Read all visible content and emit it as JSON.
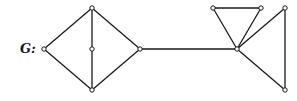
{
  "graph": {
    "label": "G:",
    "vertices": [
      {
        "id": "v1",
        "x": 44,
        "y": 49
      },
      {
        "id": "v2",
        "x": 92,
        "y": 8
      },
      {
        "id": "v3",
        "x": 92,
        "y": 49
      },
      {
        "id": "v4",
        "x": 92,
        "y": 90
      },
      {
        "id": "v5",
        "x": 140,
        "y": 49
      },
      {
        "id": "v6",
        "x": 237,
        "y": 49
      },
      {
        "id": "v7",
        "x": 213,
        "y": 8
      },
      {
        "id": "v8",
        "x": 261,
        "y": 8
      },
      {
        "id": "v9",
        "x": 285,
        "y": 8
      },
      {
        "id": "v10",
        "x": 285,
        "y": 90
      }
    ],
    "edges": [
      [
        "v1",
        "v2"
      ],
      [
        "v1",
        "v4"
      ],
      [
        "v2",
        "v3"
      ],
      [
        "v3",
        "v4"
      ],
      [
        "v2",
        "v5"
      ],
      [
        "v4",
        "v5"
      ],
      [
        "v5",
        "v6"
      ],
      [
        "v6",
        "v7"
      ],
      [
        "v7",
        "v8"
      ],
      [
        "v8",
        "v6"
      ],
      [
        "v6",
        "v9"
      ],
      [
        "v9",
        "v10"
      ],
      [
        "v10",
        "v6"
      ]
    ],
    "colors": {
      "stroke": "#1a1a1a",
      "vertex_fill": "#ffffff"
    }
  }
}
